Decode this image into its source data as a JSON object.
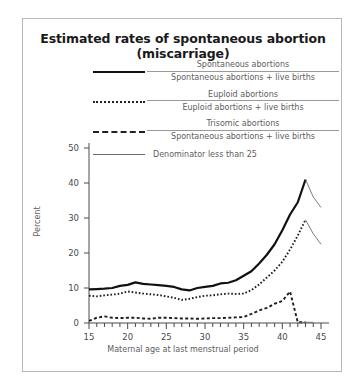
{
  "chart_data": {
    "type": "line",
    "title": "Estimated rates of spontaneous abortion (miscarriage)",
    "xlabel": "Maternal age at last menstrual period",
    "ylabel": "Percent",
    "xlim": [
      15,
      45
    ],
    "ylim": [
      0,
      50
    ],
    "xticks": [
      15,
      20,
      25,
      30,
      35,
      40,
      45
    ],
    "yticks": [
      0,
      10,
      20,
      30,
      40,
      50
    ],
    "xminor_step": 1,
    "grid": false,
    "legend_position": "top-center",
    "legend": [
      {
        "key": "solid",
        "numerator": "Spontaneous abortions",
        "denominator": "Spontaneous abortions + live births"
      },
      {
        "key": "dotted",
        "numerator": "Euploid abortions",
        "denominator": "Euploid abortions + live births"
      },
      {
        "key": "dashed",
        "numerator": "Trisomic abortions",
        "denominator": "Spontaneous abortions + live births"
      },
      {
        "key": "thin",
        "label": "Denominator less than 25"
      }
    ],
    "x": [
      15,
      16,
      17,
      18,
      19,
      20,
      21,
      22,
      23,
      24,
      25,
      26,
      27,
      28,
      29,
      30,
      31,
      32,
      33,
      34,
      35,
      36,
      37,
      38,
      39,
      40,
      41,
      42,
      43,
      44,
      45
    ],
    "series": [
      {
        "name": "Spontaneous abortions / (Spontaneous abortions + live births)",
        "style": "solid",
        "values": [
          9.6,
          9.7,
          9.8,
          10.0,
          10.6,
          10.9,
          11.6,
          11.2,
          11.0,
          10.8,
          10.6,
          10.3,
          9.6,
          9.3,
          10.0,
          10.3,
          10.6,
          11.3,
          11.5,
          12.2,
          13.5,
          14.8,
          17.0,
          19.5,
          22.5,
          26.5,
          31.0,
          34.5,
          41.0,
          null,
          null
        ],
        "low_denominator_from_x": 43,
        "low_denominator_values": [
          41.0,
          36.0,
          33.0
        ]
      },
      {
        "name": "Euploid abortions / (Euploid abortions + live births)",
        "style": "dotted",
        "values": [
          7.8,
          7.6,
          7.9,
          8.1,
          8.4,
          9.0,
          8.7,
          8.4,
          8.2,
          8.0,
          7.6,
          7.2,
          6.6,
          6.9,
          7.4,
          7.8,
          7.9,
          8.2,
          8.4,
          8.3,
          8.4,
          9.4,
          11.0,
          13.0,
          15.0,
          17.5,
          21.0,
          25.0,
          29.5,
          null,
          null
        ],
        "low_denominator_from_x": 43,
        "low_denominator_values": [
          29.5,
          25.5,
          22.5
        ]
      },
      {
        "name": "Trisomic abortions / (Spontaneous abortions + live births)",
        "style": "dashed",
        "values": [
          0.6,
          1.5,
          1.9,
          1.5,
          1.4,
          1.5,
          1.5,
          1.3,
          1.2,
          1.5,
          1.5,
          1.4,
          1.3,
          1.3,
          1.2,
          1.3,
          1.4,
          1.4,
          1.5,
          1.6,
          1.7,
          2.6,
          3.6,
          4.3,
          5.5,
          6.3,
          9.0,
          0.2,
          0.2,
          null,
          null
        ],
        "low_denominator_from_x": 42,
        "low_denominator_values": [
          0.2,
          0.2,
          0.2
        ]
      }
    ]
  }
}
